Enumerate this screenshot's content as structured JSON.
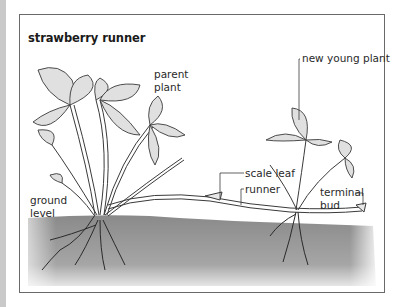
{
  "diagram": {
    "title": "strawberry runner",
    "labels": {
      "parent_plant_line1": "parent",
      "parent_plant_line2": "plant",
      "new_young_plant": "new young plant",
      "scale_leaf": "scale leaf",
      "runner": "runner",
      "terminal_bud_line1": "terminal",
      "terminal_bud_line2": "bud",
      "ground_level_line1": "ground",
      "ground_level_line2": "level"
    },
    "colors": {
      "soil": "#8e8e8e",
      "leaf_fill": "#dcdcdc",
      "outline": "#3a3a3a",
      "frame_border": "#6a6a6a"
    }
  }
}
